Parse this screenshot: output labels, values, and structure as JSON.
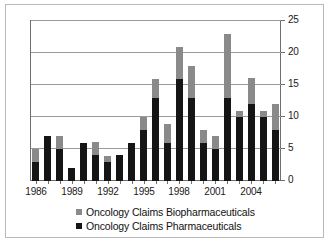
{
  "chart_data": {
    "type": "bar",
    "subtype": "stacked-column",
    "title": "",
    "xlabel": "",
    "ylabel": "",
    "ylim": [
      0,
      25
    ],
    "ytick_values": [
      0,
      5,
      10,
      15,
      20,
      25
    ],
    "ytick_labels": [
      "0",
      "5",
      "10",
      "15",
      "20",
      "25"
    ],
    "yaxis_position": "right",
    "grid": true,
    "grid_axis": "y",
    "legend_position": "bottom",
    "categories": [
      "1986",
      "1987",
      "1988",
      "1989",
      "1990",
      "1991",
      "1992",
      "1993",
      "1994",
      "1995",
      "1996",
      "1997",
      "1998",
      "1999",
      "2000",
      "2001",
      "2002",
      "2003",
      "2004",
      "2005",
      "2006"
    ],
    "xtick_labels_shown": [
      "1986",
      "1989",
      "1992",
      "1995",
      "1998",
      "2001",
      "2004"
    ],
    "series": [
      {
        "name": "Oncology Claims Pharmaceuticals",
        "color": "#151515",
        "stack_order": 0,
        "values": [
          3,
          7,
          5,
          2,
          6,
          4,
          3,
          4,
          6,
          8,
          13,
          6,
          16,
          13,
          6,
          5,
          13,
          10,
          12,
          10,
          8
        ]
      },
      {
        "name": "Oncology Claims Biopharmaceuticals",
        "color": "#8a8a8a",
        "stack_order": 1,
        "values": [
          2,
          0,
          2,
          0,
          0,
          2,
          1,
          0,
          0,
          2,
          3,
          3,
          5,
          5,
          2,
          2,
          10,
          1,
          4,
          1,
          4
        ]
      }
    ],
    "totals": [
      5,
      7,
      7,
      2,
      6,
      6,
      4,
      4,
      6,
      10,
      16,
      9,
      21,
      18,
      8,
      7,
      23,
      11,
      16,
      11,
      12
    ]
  },
  "legend": {
    "entries": [
      {
        "label": "Oncology Claims Biopharmaceuticals",
        "swatch": "bio"
      },
      {
        "label": "Oncology Claims Pharmaceuticals",
        "swatch": "pharma"
      }
    ]
  },
  "colors": {
    "biopharmaceuticals": "#8a8a8a",
    "pharmaceuticals": "#151515",
    "gridline": "#9a9a9a",
    "axis": "#6e6e6e",
    "frame": "#b9b9b9",
    "background": "#ffffff",
    "text": "#111111"
  }
}
